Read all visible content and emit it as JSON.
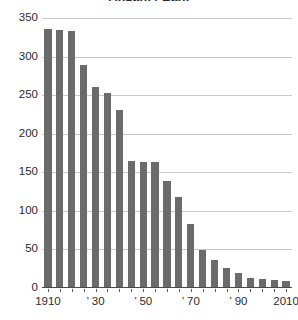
{
  "chart_data": {
    "type": "bar",
    "title": "Anzahl / Zahl",
    "xlabel": "",
    "ylabel": "",
    "ylim": [
      0,
      350
    ],
    "xlim": [
      1907.5,
      2012.5
    ],
    "grid": true,
    "legend": "none",
    "bar_color": "#6b6b6b",
    "grid_color": "#c9c9c9",
    "axis_color": "#4a4a4a",
    "categories": [
      "1910",
      "1915",
      "1920",
      "1925",
      "1930",
      "1935",
      "1940",
      "1945",
      "1950",
      "1955",
      "1960",
      "1965",
      "1970",
      "1975",
      "1980",
      "1985",
      "1990",
      "1995",
      "2000",
      "2005",
      "2010"
    ],
    "values": [
      335,
      333,
      332,
      288,
      259,
      252,
      230,
      163,
      162,
      162,
      138,
      117,
      82,
      48,
      35,
      25,
      18,
      12,
      11,
      9,
      8
    ],
    "y_ticks": [
      0,
      50,
      100,
      150,
      200,
      250,
      300,
      350
    ],
    "y_tick_labels": [
      "0",
      "50",
      "100",
      "150",
      "200",
      "250",
      "300",
      "350"
    ],
    "x_tick_labels": [
      {
        "value": 1910,
        "label": "1910"
      },
      {
        "value": 1930,
        "label": "’ 30"
      },
      {
        "value": 1950,
        "label": "’ 50"
      },
      {
        "value": 1970,
        "label": "’ 70"
      },
      {
        "value": 1990,
        "label": "’ 90"
      },
      {
        "value": 2010,
        "label": "2010"
      }
    ]
  }
}
